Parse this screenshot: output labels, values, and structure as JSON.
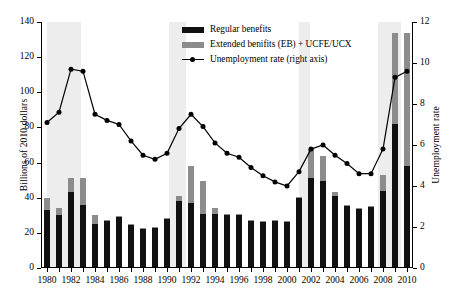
{
  "chart_data": {
    "type": "bar",
    "title": "",
    "xlabel": "",
    "ylabel": "Billions of 2010 dollars",
    "y2label": "Unemployment rate",
    "ylim": [
      0,
      140
    ],
    "y2lim": [
      0,
      12
    ],
    "yticks": [
      0,
      20,
      40,
      60,
      80,
      100,
      120,
      140
    ],
    "y2ticks": [
      0,
      2,
      4,
      6,
      8,
      10,
      12
    ],
    "grid": false,
    "legend_position": "top-center",
    "x": [
      1980,
      1981,
      1982,
      1983,
      1984,
      1985,
      1986,
      1987,
      1988,
      1989,
      1990,
      1991,
      1992,
      1993,
      1994,
      1995,
      1996,
      1997,
      1998,
      1999,
      2000,
      2001,
      2002,
      2003,
      2004,
      2005,
      2006,
      2007,
      2008,
      2009,
      2010
    ],
    "xtick_labels": [
      "1980",
      "1982",
      "1984",
      "1986",
      "1988",
      "1990",
      "1992",
      "1994",
      "1996",
      "1998",
      "2000",
      "2002",
      "2004",
      "2006",
      "2008",
      "2010"
    ],
    "xtick_values": [
      1980,
      1982,
      1984,
      1986,
      1988,
      1990,
      1992,
      1994,
      1996,
      1998,
      2000,
      2002,
      2004,
      2006,
      2008,
      2010
    ],
    "series": [
      {
        "name": "Regular benefits",
        "type": "bar",
        "stack": "benefits",
        "color": "#111111",
        "axis": "left",
        "values": [
          33,
          30,
          43,
          36,
          25,
          27,
          29,
          24.5,
          22,
          23,
          28,
          38,
          37,
          31,
          31,
          30,
          30,
          27,
          26,
          27,
          26,
          40,
          51.5,
          49.5,
          41,
          35.5,
          33.5,
          35,
          44,
          82,
          58
        ]
      },
      {
        "name": "Extended benifits (EB) + UCFE/UCX",
        "type": "bar",
        "stack": "benefits",
        "color": "#8c8c8c",
        "axis": "left",
        "values": [
          7,
          4,
          8.5,
          15,
          5,
          0.5,
          0.5,
          0.5,
          0.5,
          0.5,
          0.5,
          3,
          21,
          18.5,
          3,
          0.5,
          0.5,
          0.5,
          0.5,
          0.5,
          0.5,
          0.5,
          16.5,
          14,
          2,
          0.5,
          0.5,
          0.5,
          9,
          52,
          76
        ]
      },
      {
        "name": "Unemployment rate (right axis)",
        "type": "line",
        "color": "#000000",
        "axis": "right",
        "values": [
          7.1,
          7.6,
          9.7,
          9.6,
          7.5,
          7.2,
          7.0,
          6.2,
          5.5,
          5.3,
          5.6,
          6.8,
          7.5,
          6.9,
          6.1,
          5.6,
          5.4,
          4.9,
          4.5,
          4.2,
          4.0,
          4.7,
          5.8,
          6.0,
          5.5,
          5.1,
          4.6,
          4.6,
          5.8,
          9.3,
          9.6
        ]
      }
    ],
    "recession_bands": [
      {
        "start": 1980.0,
        "end": 1982.8
      },
      {
        "start": 1990.2,
        "end": 1991.6
      },
      {
        "start": 2001.0,
        "end": 2001.9
      },
      {
        "start": 2007.6,
        "end": 2009.5
      }
    ],
    "band_color": "#ededed"
  },
  "legend": {
    "items": [
      {
        "label": "Regular benefits",
        "marker": "swatch-black"
      },
      {
        "label": "Extended benifits (EB) + UCFE/UCX",
        "marker": "swatch-gray"
      },
      {
        "label": "Unemployment rate (right axis)",
        "marker": "line-dot"
      }
    ]
  }
}
